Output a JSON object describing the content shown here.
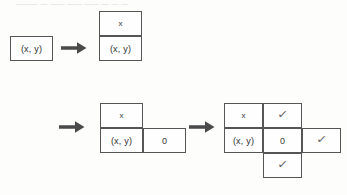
{
  "caption": {
    "top_strip_text": "———  —  ——  ——  ——   —  —  ——"
  },
  "diagram": {
    "colors": {
      "border": "#565656",
      "cell_background": "#fefefe",
      "page_background": "#fdfdfc",
      "text": "#2f2f2f",
      "arrow": "#4a4a4a",
      "check": "#6a6a6a"
    },
    "symbols": {
      "coordinate": "(x, y)",
      "cross": "x",
      "zero": "0",
      "check": "✓",
      "arrow": "→"
    },
    "steps": [
      {
        "id": "step-1",
        "label": "single cell",
        "cells": [
          {
            "row": 0,
            "col": 0,
            "value": "(x, y)",
            "kind": "coord"
          }
        ]
      },
      {
        "id": "step-2",
        "label": "vertical domino",
        "cells": [
          {
            "row": 0,
            "col": 0,
            "value": "x",
            "kind": "cross"
          },
          {
            "row": 1,
            "col": 0,
            "value": "(x, y)",
            "kind": "coord"
          }
        ]
      },
      {
        "id": "step-3",
        "label": "L tromino",
        "cells": [
          {
            "row": 0,
            "col": 0,
            "value": "x",
            "kind": "cross"
          },
          {
            "row": 1,
            "col": 0,
            "value": "(x, y)",
            "kind": "coord"
          },
          {
            "row": 1,
            "col": 1,
            "value": "0",
            "kind": "zero"
          }
        ]
      },
      {
        "id": "step-4",
        "label": "plus shape",
        "cells": [
          {
            "row": 0,
            "col": 0,
            "value": "x",
            "kind": "cross"
          },
          {
            "row": 0,
            "col": 1,
            "value": "✓",
            "kind": "check"
          },
          {
            "row": 1,
            "col": 0,
            "value": "(x, y)",
            "kind": "coord"
          },
          {
            "row": 1,
            "col": 1,
            "value": "0",
            "kind": "zero"
          },
          {
            "row": 1,
            "col": 2,
            "value": "✓",
            "kind": "check"
          },
          {
            "row": 2,
            "col": 1,
            "value": "✓",
            "kind": "check"
          }
        ]
      }
    ],
    "arrows": [
      {
        "id": "arrow-1",
        "from": "step-1",
        "to": "step-2"
      },
      {
        "id": "arrow-2",
        "from": "step-3-row",
        "to": "step-3"
      },
      {
        "id": "arrow-3",
        "from": "step-3",
        "to": "step-4"
      }
    ]
  }
}
